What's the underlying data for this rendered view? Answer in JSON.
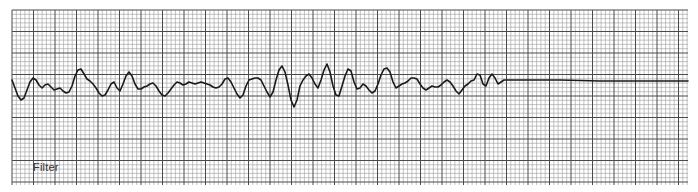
{
  "strip": {
    "label": "Filter",
    "colors": {
      "background": "#ffffff",
      "minor_grid": "#9a9a9a",
      "major_grid": "#4a4a4a",
      "trace": "#1a1a1a"
    },
    "grid": {
      "left": 12,
      "top": 10,
      "right": 688,
      "bottom": 185,
      "minor_step": 4.3,
      "major_every": 5
    },
    "trace_points": [
      [
        12,
        80
      ],
      [
        15,
        88
      ],
      [
        18,
        96
      ],
      [
        21,
        100
      ],
      [
        24,
        98
      ],
      [
        27,
        90
      ],
      [
        30,
        82
      ],
      [
        33,
        78
      ],
      [
        36,
        80
      ],
      [
        39,
        85
      ],
      [
        42,
        88
      ],
      [
        45,
        85
      ],
      [
        48,
        84
      ],
      [
        51,
        87
      ],
      [
        54,
        90
      ],
      [
        57,
        89
      ],
      [
        60,
        88
      ],
      [
        63,
        91
      ],
      [
        66,
        93
      ],
      [
        69,
        92
      ],
      [
        72,
        86
      ],
      [
        75,
        76
      ],
      [
        78,
        70
      ],
      [
        81,
        69
      ],
      [
        84,
        74
      ],
      [
        87,
        79
      ],
      [
        90,
        81
      ],
      [
        93,
        84
      ],
      [
        96,
        88
      ],
      [
        99,
        93
      ],
      [
        102,
        96
      ],
      [
        105,
        95
      ],
      [
        108,
        90
      ],
      [
        111,
        84
      ],
      [
        114,
        82
      ],
      [
        117,
        88
      ],
      [
        120,
        91
      ],
      [
        123,
        84
      ],
      [
        126,
        76
      ],
      [
        129,
        72
      ],
      [
        132,
        76
      ],
      [
        135,
        84
      ],
      [
        138,
        89
      ],
      [
        141,
        89
      ],
      [
        144,
        87
      ],
      [
        147,
        86
      ],
      [
        150,
        84
      ],
      [
        153,
        83
      ],
      [
        156,
        86
      ],
      [
        159,
        91
      ],
      [
        162,
        95
      ],
      [
        165,
        96
      ],
      [
        168,
        93
      ],
      [
        171,
        89
      ],
      [
        174,
        85
      ],
      [
        177,
        82
      ],
      [
        180,
        83
      ],
      [
        183,
        85
      ],
      [
        186,
        84
      ],
      [
        189,
        82
      ],
      [
        192,
        83
      ],
      [
        195,
        84
      ],
      [
        198,
        83
      ],
      [
        201,
        82
      ],
      [
        204,
        83
      ],
      [
        207,
        84
      ],
      [
        210,
        85
      ],
      [
        213,
        87
      ],
      [
        216,
        88
      ],
      [
        219,
        87
      ],
      [
        222,
        84
      ],
      [
        225,
        79
      ],
      [
        228,
        78
      ],
      [
        231,
        82
      ],
      [
        234,
        88
      ],
      [
        237,
        94
      ],
      [
        240,
        98
      ],
      [
        243,
        95
      ],
      [
        246,
        86
      ],
      [
        249,
        80
      ],
      [
        252,
        79
      ],
      [
        255,
        78
      ],
      [
        258,
        78
      ],
      [
        261,
        80
      ],
      [
        264,
        86
      ],
      [
        267,
        92
      ],
      [
        270,
        97
      ],
      [
        273,
        92
      ],
      [
        276,
        80
      ],
      [
        279,
        70
      ],
      [
        282,
        66
      ],
      [
        285,
        72
      ],
      [
        288,
        85
      ],
      [
        291,
        100
      ],
      [
        294,
        107
      ],
      [
        297,
        100
      ],
      [
        300,
        86
      ],
      [
        303,
        80
      ],
      [
        306,
        76
      ],
      [
        309,
        74
      ],
      [
        312,
        78
      ],
      [
        315,
        84
      ],
      [
        318,
        88
      ],
      [
        321,
        80
      ],
      [
        324,
        70
      ],
      [
        327,
        64
      ],
      [
        330,
        72
      ],
      [
        333,
        86
      ],
      [
        336,
        95
      ],
      [
        339,
        96
      ],
      [
        342,
        86
      ],
      [
        345,
        76
      ],
      [
        348,
        69
      ],
      [
        351,
        71
      ],
      [
        354,
        82
      ],
      [
        357,
        89
      ],
      [
        360,
        88
      ],
      [
        363,
        84
      ],
      [
        366,
        86
      ],
      [
        369,
        90
      ],
      [
        372,
        93
      ],
      [
        375,
        91
      ],
      [
        378,
        84
      ],
      [
        381,
        75
      ],
      [
        384,
        69
      ],
      [
        387,
        68
      ],
      [
        390,
        72
      ],
      [
        393,
        82
      ],
      [
        396,
        88
      ],
      [
        399,
        86
      ],
      [
        402,
        84
      ],
      [
        405,
        83
      ],
      [
        408,
        81
      ],
      [
        411,
        78
      ],
      [
        414,
        78
      ],
      [
        417,
        79
      ],
      [
        420,
        84
      ],
      [
        423,
        88
      ],
      [
        426,
        90
      ],
      [
        429,
        88
      ],
      [
        432,
        86
      ],
      [
        435,
        87
      ],
      [
        438,
        87
      ],
      [
        441,
        85
      ],
      [
        444,
        82
      ],
      [
        447,
        80
      ],
      [
        450,
        82
      ],
      [
        453,
        86
      ],
      [
        456,
        91
      ],
      [
        459,
        94
      ],
      [
        462,
        90
      ],
      [
        465,
        86
      ],
      [
        468,
        84
      ],
      [
        471,
        81
      ],
      [
        474,
        80
      ],
      [
        477,
        74
      ],
      [
        480,
        75
      ],
      [
        483,
        84
      ],
      [
        486,
        86
      ],
      [
        489,
        78
      ],
      [
        492,
        74
      ],
      [
        495,
        78
      ],
      [
        498,
        84
      ],
      [
        501,
        82
      ],
      [
        504,
        80
      ],
      [
        520,
        80
      ],
      [
        560,
        80
      ],
      [
        600,
        81
      ],
      [
        640,
        81
      ],
      [
        688,
        81
      ]
    ]
  }
}
